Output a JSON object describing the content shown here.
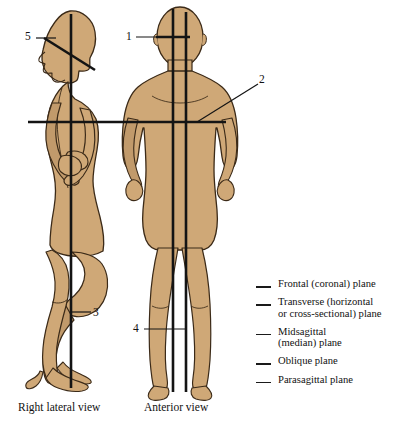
{
  "background_color": "#ffffff",
  "colors": {
    "skin_fill": "#cfa877",
    "skin_shadow": "#c19a6b",
    "outline": "#3b2a18",
    "plane_line": "#141414",
    "text": "#111111"
  },
  "figures": [
    {
      "id": "lateral",
      "caption": "Right lateral view"
    },
    {
      "id": "anterior",
      "caption": "Anterior view"
    }
  ],
  "captions": {
    "lateral": "Right lateral view",
    "anterior": "Anterior view"
  },
  "number_labels": [
    {
      "id": "1",
      "text": "1",
      "points_to": "transverse plane on head, anterior view"
    },
    {
      "id": "2",
      "text": "2",
      "points_to": "transverse plane at waist, anterior view"
    },
    {
      "id": "3",
      "text": "3",
      "points_to": "frontal (coronal) plane, lateral view"
    },
    {
      "id": "4",
      "text": "4",
      "points_to": "parasagittal plane, anterior view"
    },
    {
      "id": "5",
      "text": "5",
      "points_to": "oblique plane on head, lateral view"
    }
  ],
  "legend": {
    "items": [
      {
        "blank": "___",
        "label": "Frontal (coronal) plane"
      },
      {
        "blank": "___",
        "label": "Transverse (horizontal\nor cross-sectional) plane"
      },
      {
        "blank": "___",
        "label": "Midsagittal\n(median) plane"
      },
      {
        "blank": "___",
        "label": "Oblique plane"
      },
      {
        "blank": "___",
        "label": "Parasagittal plane"
      }
    ]
  }
}
